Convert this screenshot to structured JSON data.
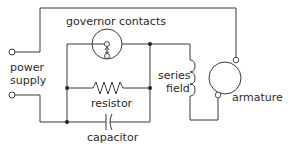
{
  "diagram": {
    "type": "electrical-circuit",
    "title": "",
    "labels": {
      "governor_contacts": "governor contacts",
      "power_supply_line1": "power",
      "power_supply_line2": "supply",
      "resistor": "resistor",
      "capacitor": "capacitor",
      "series_field_line1": "series",
      "series_field_line2": "field",
      "armature": "armature"
    },
    "components": [
      {
        "id": "power-supply",
        "kind": "terminals",
        "count": 2
      },
      {
        "id": "governor-contacts",
        "kind": "switch-in-circle"
      },
      {
        "id": "resistor",
        "kind": "resistor"
      },
      {
        "id": "capacitor",
        "kind": "capacitor"
      },
      {
        "id": "series-field",
        "kind": "inductor-coil"
      },
      {
        "id": "armature",
        "kind": "motor-armature"
      }
    ],
    "colors": {
      "line": "#3a3a3a",
      "text": "#2a2a2a",
      "background": "#ffffff"
    }
  }
}
